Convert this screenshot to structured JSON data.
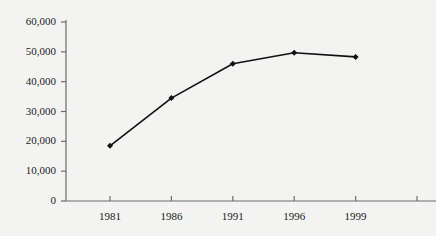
{
  "chart_data": {
    "type": "line",
    "title": "",
    "subtitle": "",
    "xlabel": "",
    "ylabel": "",
    "categories": [
      "1981",
      "1986",
      "1991",
      "1996",
      "1999"
    ],
    "values": [
      18500,
      34500,
      46000,
      49700,
      48300
    ],
    "series": [
      {
        "name": "",
        "values": [
          18500,
          34500,
          46000,
          49700,
          48300
        ]
      }
    ],
    "ylim": [
      0,
      60000
    ],
    "yticks": [
      0,
      10000,
      20000,
      30000,
      40000,
      50000,
      60000
    ],
    "ytick_labels": [
      "0",
      "10,000",
      "20,000",
      "30,000",
      "40,000",
      "50,000",
      "60,000"
    ],
    "xtick_labels": [
      "1981",
      "1986",
      "1991",
      "1996",
      "1999"
    ],
    "grid": false,
    "legend": "none",
    "annotations": [],
    "line_color": "#111111",
    "marker_color": "#111111",
    "marker_shape": "diamond",
    "axis_color": "#6b6b6b",
    "background_color": "#f3f4f2",
    "extra_unlabeled_tick": true
  },
  "axes": {
    "y_axis_name": "value-axis",
    "x_axis_name": "year-axis"
  }
}
